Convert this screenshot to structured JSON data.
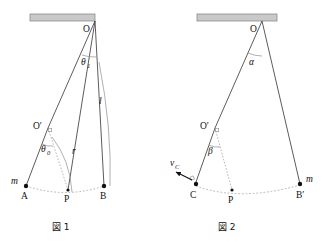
{
  "page": {
    "header_fragment": "",
    "background": "#ffffff",
    "width": 334,
    "height": 242
  },
  "colors": {
    "ceiling_fill": "#c9c9c9",
    "ceiling_stroke": "#8c8c8c",
    "string": "#4a4a4a",
    "dashed": "#9a9a9a",
    "point": "#111111",
    "text": "#111111",
    "arc_thin": "#8e8e8e"
  },
  "figure1": {
    "caption": "図 1",
    "labels": {
      "pivot_top": "O",
      "pivot_peg": "O′",
      "angle_top": "θ",
      "angle_top_sub": "1",
      "angle_peg": "θ",
      "angle_peg_sub": "0",
      "string_length": "l",
      "radius": "r",
      "mass": "m",
      "point_left": "A",
      "point_bottom": "P",
      "point_right": "B"
    }
  },
  "figure2": {
    "caption": "図 2",
    "labels": {
      "pivot_top": "O",
      "pivot_peg": "O′",
      "angle_top": "α",
      "angle_peg": "β",
      "velocity": "v",
      "velocity_sub": "C",
      "mass": "m",
      "point_left": "C",
      "point_bottom": "P",
      "point_right": "B′"
    }
  }
}
